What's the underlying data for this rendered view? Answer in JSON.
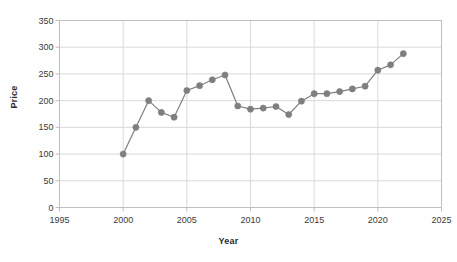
{
  "chart_data": {
    "type": "line",
    "title": "",
    "xlabel": "Year",
    "ylabel": "Price",
    "grid": true,
    "legend": false,
    "xlim": [
      1995,
      2025
    ],
    "ylim": [
      0,
      350
    ],
    "xticks": [
      "1995",
      "2000",
      "2005",
      "2010",
      "2015",
      "2020",
      "2025"
    ],
    "yticks": [
      "0",
      "50",
      "100",
      "150",
      "200",
      "250",
      "300",
      "350"
    ],
    "marker": "circle",
    "series_color": "#7f7f7f",
    "grid_color": "#d9d9d9",
    "axis_color": "#bfbfbf",
    "x": [
      2000,
      2001,
      2002,
      2003,
      2004,
      2005,
      2006,
      2007,
      2008,
      2009,
      2010,
      2011,
      2012,
      2013,
      2014,
      2015,
      2016,
      2017,
      2018,
      2019,
      2020,
      2021,
      2022
    ],
    "values": [
      100,
      150,
      200,
      178,
      169,
      219,
      228,
      239,
      248,
      190,
      184,
      186,
      189,
      174,
      199,
      213,
      213,
      217,
      222,
      227,
      257,
      267,
      288
    ]
  }
}
